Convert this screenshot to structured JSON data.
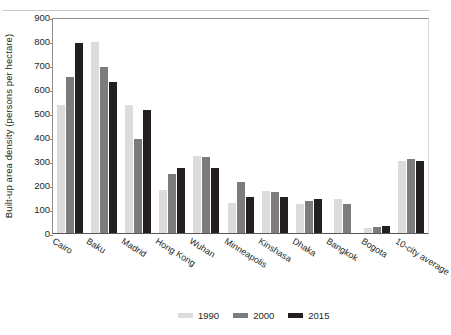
{
  "chart_data": {
    "type": "bar",
    "title": "",
    "subtitle": "",
    "xlabel": "",
    "ylabel": "Built-up area density (persons per hectare)",
    "ylim": [
      0,
      900
    ],
    "yticks": [
      0,
      100,
      200,
      300,
      400,
      500,
      600,
      700,
      800,
      900
    ],
    "grid": false,
    "legend_position": "bottom",
    "categories": [
      "Cairo",
      "Baku",
      "Madrid",
      "Hong Kong",
      "Wuhan",
      "Minneapolis",
      "Kinshasa",
      "Dhaka",
      "Bangkok",
      "Bogota",
      "10-city average"
    ],
    "series": [
      {
        "name": "1990",
        "color": "#dcdcdc",
        "values": [
          535,
          795,
          535,
          180,
          320,
          125,
          175,
          120,
          142,
          22,
          302
        ]
      },
      {
        "name": "2000",
        "color": "#7c7c7e",
        "values": [
          650,
          690,
          390,
          245,
          315,
          212,
          170,
          133,
          122,
          26,
          308
        ]
      },
      {
        "name": "2015",
        "color": "#231f20",
        "values": [
          790,
          630,
          512,
          270,
          270,
          148,
          148,
          140,
          0,
          28,
          300
        ]
      }
    ]
  },
  "legend": {
    "items": [
      {
        "label": "1990",
        "swatch": "legend-swatch-1990"
      },
      {
        "label": "2000",
        "swatch": "legend-swatch-2000"
      },
      {
        "label": "2015",
        "swatch": "legend-swatch-2015"
      }
    ]
  }
}
